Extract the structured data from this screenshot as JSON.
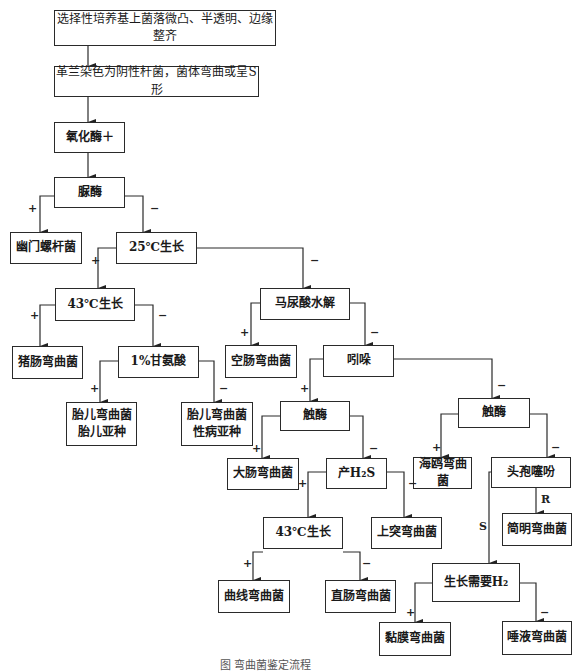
{
  "title": "弯曲菌鉴定流程",
  "nodes": {
    "n1": "选择性培养基上菌落微凸、半透明、边缘整齐",
    "n2": "革兰染色为阴性杆菌，菌体弯曲或呈S形",
    "n3": "氧化酶＋",
    "n4": "脲酶",
    "n5": "幽门螺杆菌",
    "n6": "25℃生长",
    "n7": "43℃生长",
    "n8": "马尿酸水解",
    "n9": "猪肠弯曲菌",
    "n10": "1%甘氨酸",
    "n11": "空肠弯曲菌",
    "n12": "吲哚",
    "n13": "胎儿弯曲菌\n胎儿亚种",
    "n14": "胎儿弯曲菌\n性病亚种",
    "n15": "触酶",
    "n16": "触酶",
    "n17": "大肠弯曲菌",
    "n18": "产H₂S",
    "n19": "海鸥弯曲菌",
    "n20": "头孢噻吩",
    "n21": "43℃生长",
    "n22": "上突弯曲菌",
    "n23": "简明弯曲菌",
    "n24": "曲线弯曲菌",
    "n25": "直肠弯曲菌",
    "n26": "生长需要H₂",
    "n27": "黏膜弯曲菌",
    "n28": "唾液弯曲菌"
  },
  "edge_labels": {
    "plus": "+",
    "minus": "−",
    "resistant": "R",
    "sensitive": "S"
  },
  "caption": "图 弯曲菌鉴定流程"
}
